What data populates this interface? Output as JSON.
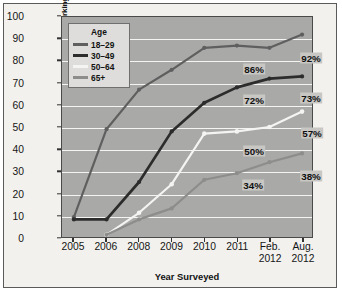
{
  "chart_data": {
    "type": "line",
    "title": "",
    "xlabel": "Year Surveyed",
    "ylabel": "Percentage of Internet Users Accessing Social Networking Sites",
    "categories": [
      "2005",
      "2006",
      "2008",
      "2009",
      "2010",
      "2011",
      "Feb. 2012",
      "Aug. 2012"
    ],
    "ylim": [
      0,
      100
    ],
    "ytick_step": 10,
    "yticks": [
      0,
      10,
      20,
      30,
      40,
      50,
      60,
      70,
      80,
      90,
      100
    ],
    "grid": true,
    "legend_position": "top-left-inside",
    "legend_title": "Age",
    "series": [
      {
        "name": "18–29",
        "color": "#5f5f5f",
        "values": [
          9,
          49,
          67,
          76,
          86,
          87,
          86,
          92
        ]
      },
      {
        "name": "30–49",
        "color": "#2c2c2c",
        "values": [
          8,
          8,
          25,
          48,
          61,
          68,
          72,
          73
        ]
      },
      {
        "name": "50–64",
        "color": "#f4f4f2",
        "values": [
          null,
          1,
          11,
          24,
          47,
          48,
          50,
          57
        ]
      },
      {
        "name": "65+",
        "color": "#8d8d8b",
        "values": [
          null,
          1,
          8,
          13,
          26,
          29,
          34,
          38
        ]
      }
    ],
    "annotations": [
      {
        "text": "86%",
        "series": "18–29",
        "category": "Feb. 2012",
        "value": 86
      },
      {
        "text": "92%",
        "series": "18–29",
        "category": "Aug. 2012",
        "value": 92
      },
      {
        "text": "72%",
        "series": "30–49",
        "category": "Feb. 2012",
        "value": 72
      },
      {
        "text": "73%",
        "series": "30–49",
        "category": "Aug. 2012",
        "value": 73
      },
      {
        "text": "50%",
        "series": "50–64",
        "category": "Feb. 2012",
        "value": 50
      },
      {
        "text": "57%",
        "series": "50–64",
        "category": "Aug. 2012",
        "value": 57
      },
      {
        "text": "34%",
        "series": "65+",
        "category": "Feb. 2012",
        "value": 34
      },
      {
        "text": "38%",
        "series": "65+",
        "category": "Aug. 2012",
        "value": 38
      }
    ]
  },
  "style": {
    "plot_background": "#a9a9a7",
    "figure_background": "#f2f1ee",
    "gridline_color": "#f4f4f2",
    "axis_color": "#4a4a4a",
    "text_color": "#131313",
    "legend_background": "#dedddb",
    "callout_background": "#c8c7c4"
  },
  "legend": {
    "title": "Age",
    "entries": [
      {
        "label": "18–29"
      },
      {
        "label": "30–49"
      },
      {
        "label": "50–64"
      },
      {
        "label": "65+"
      }
    ]
  },
  "axes": {
    "y_title": "Percentage of Internet Users Accessing Social Networking Sites",
    "x_title": "Year Surveyed"
  }
}
